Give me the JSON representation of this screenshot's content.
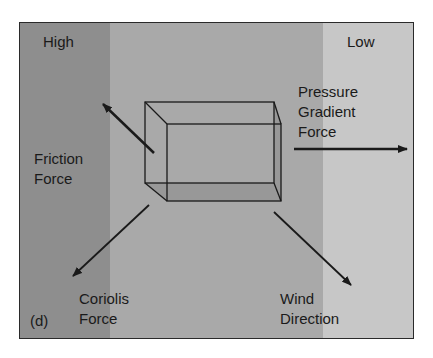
{
  "diagram": {
    "panel_label": "(d)",
    "regions": {
      "high": "High",
      "low": "Low"
    },
    "forces": {
      "friction": {
        "line1": "Friction",
        "line2": "Force"
      },
      "pressure_gradient": {
        "line1": "Pressure",
        "line2": "Gradient",
        "line3": "Force"
      },
      "coriolis": {
        "line1": "Coriolis",
        "line2": "Force"
      },
      "wind": {
        "line1": "Wind",
        "line2": "Direction"
      }
    },
    "colors": {
      "high_band": "#8e8e8e",
      "mid_band": "#a9a9a9",
      "low_band": "#c7c7c7",
      "ink": "#1a1a1a"
    }
  }
}
